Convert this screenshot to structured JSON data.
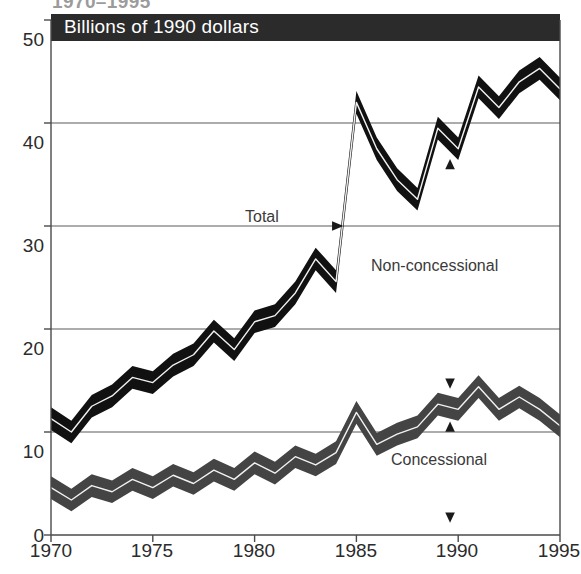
{
  "figure": {
    "clipped_heading": "1970–1995",
    "banner_label": "Billions of 1990 dollars"
  },
  "annotations": {
    "total": "Total",
    "non_concessional": "Non-concessional",
    "concessional": "Concessional"
  },
  "axes": {
    "y_ticks": [
      "0",
      "10",
      "20",
      "30",
      "40",
      "50"
    ],
    "x_ticks": [
      "1970",
      "1975",
      "1980",
      "1985",
      "1990",
      "1995"
    ]
  },
  "colors": {
    "banner": "#2b2b2b",
    "total_band": "#111111",
    "concessional_band": "#444444",
    "centerline": "#f2f2f2",
    "gridline": "#5a5a5a",
    "axis": "#4a4a4a"
  },
  "chart_data": {
    "type": "area",
    "title": "Billions of 1990 dollars",
    "xlabel": "",
    "ylabel": "Billions of 1990 dollars",
    "xlim": [
      1970,
      1995
    ],
    "ylim": [
      0,
      50
    ],
    "grid": true,
    "legend": "inline-annotations",
    "x": [
      1970,
      1971,
      1972,
      1973,
      1974,
      1975,
      1976,
      1977,
      1978,
      1979,
      1980,
      1981,
      1982,
      1983,
      1984,
      1985,
      1986,
      1987,
      1988,
      1989,
      1990,
      1991,
      1992,
      1993,
      1994,
      1995
    ],
    "series": [
      {
        "name": "Total",
        "note": "upper black band, plotted as band with centre line",
        "values": [
          11.3,
          10.0,
          12.5,
          13.5,
          15.3,
          14.8,
          16.5,
          17.5,
          19.8,
          18.0,
          20.7,
          21.3,
          23.5,
          26.8,
          24.6,
          42.0,
          37.5,
          34.5,
          32.6,
          39.5,
          37.5,
          43.5,
          41.5,
          44.0,
          45.3,
          43.3
        ],
        "band_half_width": 1.1,
        "color": "#111111"
      },
      {
        "name": "Concessional",
        "note": "lower dark-grey band, plotted as band with centre line",
        "values": [
          4.6,
          3.4,
          4.8,
          4.2,
          5.4,
          4.6,
          5.8,
          5.0,
          6.3,
          5.4,
          7.0,
          6.0,
          7.6,
          6.8,
          8.0,
          11.9,
          8.8,
          9.8,
          10.5,
          12.7,
          12.2,
          14.4,
          12.2,
          13.4,
          12.2,
          10.6
        ],
        "band_half_width": 1.1,
        "color": "#444444"
      }
    ],
    "markers": [
      {
        "name": "total-pointer",
        "shape": "triangle-right",
        "x": 1984.1,
        "y": 30.0
      },
      {
        "name": "non-concessional-pointer",
        "shape": "triangle-up",
        "x": 1989.6,
        "y": 36.1
      },
      {
        "name": "concessional-upper-pointer",
        "shape": "triangle-down",
        "x": 1989.6,
        "y": 14.6
      },
      {
        "name": "concessional-lower-pointer",
        "shape": "triangle-up",
        "x": 1989.6,
        "y": 10.6
      },
      {
        "name": "axis-pointer",
        "shape": "triangle-down",
        "x": 1989.6,
        "y": 1.6
      }
    ]
  }
}
